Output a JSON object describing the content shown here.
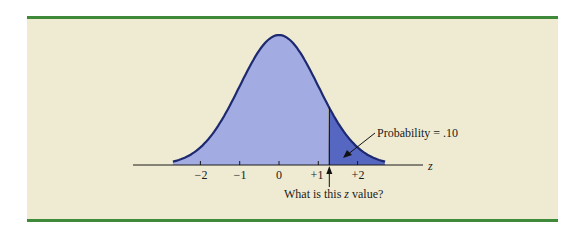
{
  "figure": {
    "axis_variable": "z",
    "tick_labels": [
      "−2",
      "−1",
      "0",
      "+1",
      "+2"
    ],
    "tick_values": [
      -2,
      -1,
      0,
      1,
      2
    ],
    "annotation_probability": "Probability = .10",
    "question_prefix": "What is this ",
    "question_var": "z",
    "question_suffix": " value?",
    "colors": {
      "background": "#efebd2",
      "rule": "#3f8a3a",
      "curve_fill": "#a2abe2",
      "tail_fill": "#5667c2",
      "curve_stroke": "#1d2970"
    }
  },
  "chart_data": {
    "type": "area",
    "title": "",
    "distribution": "standard normal",
    "xlabel": "z",
    "ylabel": "",
    "x_ticks": [
      -2,
      -1,
      0,
      1,
      2
    ],
    "shaded_upper_tail": {
      "from_z": 1.28,
      "probability": 0.1
    },
    "annotations": [
      "Probability = .10",
      "What is this z value?"
    ],
    "grid": false,
    "legend": false
  }
}
